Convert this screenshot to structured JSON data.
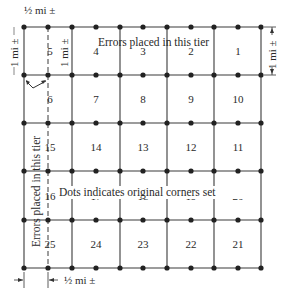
{
  "diagram": {
    "colors": {
      "line": "#3a3a3a",
      "dot": "#222222",
      "text": "#2a2a2a",
      "background": "#ffffff"
    },
    "grid": {
      "x_lines": [
        24,
        72,
        120,
        167,
        214,
        261
      ],
      "dashed_x": 48,
      "y_lines": [
        27,
        75,
        123,
        171,
        220,
        268
      ],
      "dot_x": [
        24,
        48,
        72,
        96,
        120,
        143,
        167,
        191,
        214,
        238,
        261
      ]
    },
    "sections": [
      {
        "number": "5",
        "x": 50,
        "y": 55
      },
      {
        "number": "4",
        "x": 96,
        "y": 55
      },
      {
        "number": "3",
        "x": 143,
        "y": 55
      },
      {
        "number": "2",
        "x": 191,
        "y": 55
      },
      {
        "number": "1",
        "x": 238,
        "y": 55
      },
      {
        "number": "6",
        "x": 50,
        "y": 103
      },
      {
        "number": "7",
        "x": 96,
        "y": 103
      },
      {
        "number": "8",
        "x": 143,
        "y": 103
      },
      {
        "number": "9",
        "x": 191,
        "y": 103
      },
      {
        "number": "10",
        "x": 238,
        "y": 103
      },
      {
        "number": "15",
        "x": 50,
        "y": 151
      },
      {
        "number": "14",
        "x": 96,
        "y": 151
      },
      {
        "number": "13",
        "x": 143,
        "y": 151
      },
      {
        "number": "12",
        "x": 191,
        "y": 151
      },
      {
        "number": "11",
        "x": 238,
        "y": 151
      },
      {
        "number": "16",
        "x": 50,
        "y": 200
      },
      {
        "number": "17",
        "x": 96,
        "y": 200
      },
      {
        "number": "18",
        "x": 143,
        "y": 200
      },
      {
        "number": "19",
        "x": 191,
        "y": 200
      },
      {
        "number": "20",
        "x": 238,
        "y": 200
      },
      {
        "number": "25",
        "x": 50,
        "y": 248
      },
      {
        "number": "24",
        "x": 96,
        "y": 248
      },
      {
        "number": "23",
        "x": 143,
        "y": 248
      },
      {
        "number": "22",
        "x": 191,
        "y": 248
      },
      {
        "number": "21",
        "x": 238,
        "y": 248
      }
    ],
    "labels": {
      "top_tier_errors": "Errors placed in this tier",
      "left_tier_errors": "Errors placed in this tier",
      "dots_note": "Dots indicates original corners set",
      "half_mile_top": "½ mi ±",
      "half_mile_bottom": "½ mi ±",
      "one_mile_left": "1 mi ±",
      "one_mile_inner": "1 mi ±",
      "one_mile_right": "1 mi ±"
    }
  }
}
